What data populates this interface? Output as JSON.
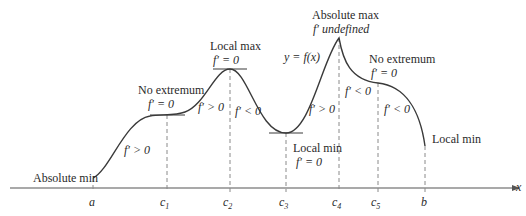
{
  "axis": {
    "x_label": "x"
  },
  "ticks": [
    {
      "id": "a",
      "label": "a",
      "x": 93
    },
    {
      "id": "c1",
      "label": "c",
      "sub": "1",
      "x": 167
    },
    {
      "id": "c2",
      "label": "c",
      "sub": "2",
      "x": 230
    },
    {
      "id": "c3",
      "label": "c",
      "sub": "3",
      "x": 286
    },
    {
      "id": "c4",
      "label": "c",
      "sub": "4",
      "x": 339
    },
    {
      "id": "c5",
      "label": "c",
      "sub": "5",
      "x": 378
    },
    {
      "id": "b",
      "label": "b",
      "x": 425
    }
  ],
  "curve_label": "y = f(x)",
  "annotations": {
    "abs_min": "Absolute min",
    "no_ext1_title": "No extremum",
    "no_ext1_cond": "f′ = 0",
    "local_max_title": "Local max",
    "local_max_cond": "f′ = 0",
    "local_min_title": "Local min",
    "local_min_cond": "f′ = 0",
    "abs_max_title": "Absolute max",
    "abs_max_cond": "f′  undefined",
    "no_ext2_title": "No extremum",
    "no_ext2_cond": "f′ = 0",
    "end_local_min": "Local min"
  },
  "derivative_signs": {
    "s1": "f′ > 0",
    "s2": "f′ > 0",
    "s3": "f′ < 0",
    "s4": "f′ > 0",
    "s5": "f′ < 0",
    "s6": "f′ < 0"
  },
  "colors": {
    "line": "#3a3a3a",
    "dash": "#8a8a8a"
  }
}
